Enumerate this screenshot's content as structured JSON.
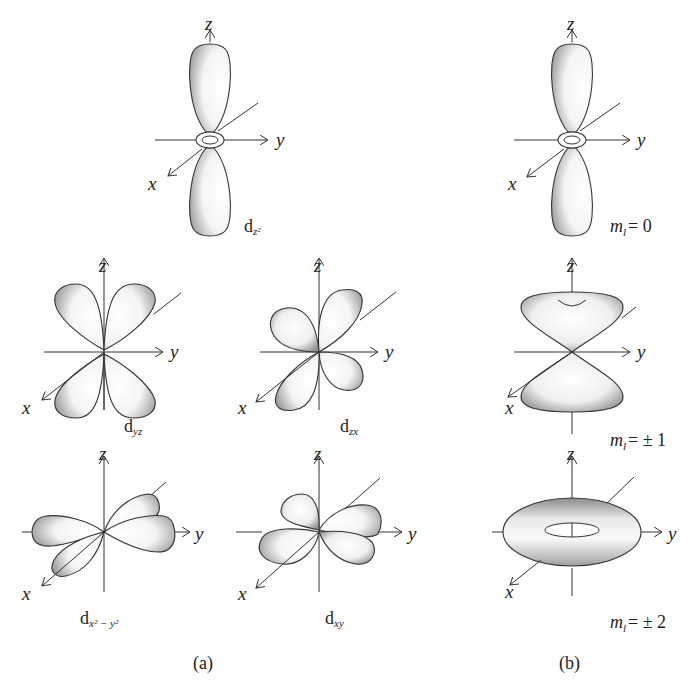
{
  "figure": {
    "panels": [
      {
        "id": "a",
        "label": "(a)"
      },
      {
        "id": "b",
        "label": "(b)"
      }
    ],
    "axes": {
      "x": "x",
      "y": "y",
      "z": "z"
    },
    "orbitals_a": [
      {
        "name": "dz2",
        "main": "d",
        "subscript": "z²"
      },
      {
        "name": "dyz",
        "main": "d",
        "subscript": "yz"
      },
      {
        "name": "dzx",
        "main": "d",
        "subscript": "zx"
      },
      {
        "name": "dx2-y2",
        "main": "d",
        "subscript": "x² − y²"
      },
      {
        "name": "dxy",
        "main": "d",
        "subscript": "xy"
      }
    ],
    "orbitals_b": [
      {
        "name": "ml0",
        "label": "m",
        "sub": "l",
        "value": "= 0"
      },
      {
        "name": "ml1",
        "label": "m",
        "sub": "l",
        "value": "= ± 1"
      },
      {
        "name": "ml2",
        "label": "m",
        "sub": "l",
        "value": "= ± 2"
      }
    ],
    "colors": {
      "line": "#333333",
      "shade": "#9a9a9a",
      "fill": "#ffffff"
    }
  }
}
